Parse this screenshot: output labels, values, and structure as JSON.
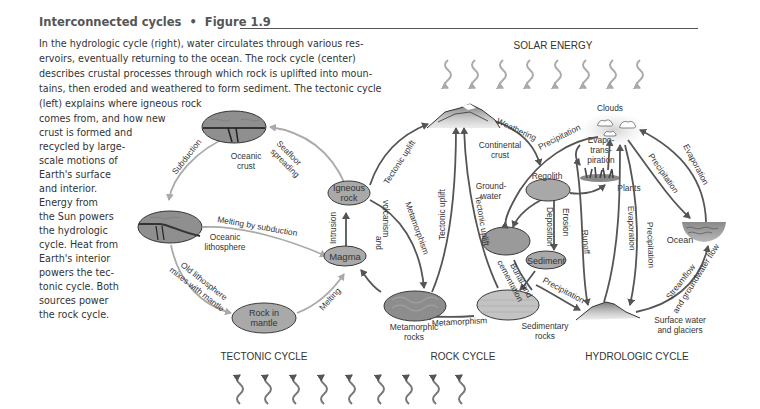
{
  "figure": {
    "title": "Interconnected cycles",
    "separator": "•",
    "number": "Figure 1.9",
    "caption_lines": [
      "In the hydrologic cycle (right), water circulates through various res-",
      "ervoirs, eventually returning to the ocean. The rock cycle (center)",
      "describes crustal processes through which rock is uplifted into moun-",
      "tains, then eroded and weathered to form sediment. The tectonic cycle",
      "(left) explains where igneous rock",
      "comes from, and how new",
      "crust is formed and",
      "recycled by large-",
      "scale motions of",
      "Earth's surface",
      "and interior.",
      "Energy from",
      "the Sun powers",
      "the hydrologic",
      "cycle. Heat from",
      "Earth's interior",
      "powers the tec-",
      "tonic cycle. Both",
      "sources power",
      "the rock cycle."
    ]
  },
  "energy": {
    "solar_label": "SOLAR ENERGY",
    "solar_arrow_count": 8,
    "internal_arrow_count": 9
  },
  "cycles": {
    "tectonic": "TECTONIC CYCLE",
    "rock": "ROCK CYCLE",
    "hydrologic": "HYDROLOGIC CYCLE"
  },
  "nodes": {
    "oceanic_crust": [
      "Oceanic",
      "crust"
    ],
    "oceanic_lithosphere": [
      "Oceanic",
      "lithosphere"
    ],
    "rock_in_mantle": [
      "Rock in",
      "mantle"
    ],
    "igneous_rock": [
      "Igneous",
      "rock"
    ],
    "magma": "Magma",
    "metamorphic_rocks": [
      "Metamorphic",
      "rocks"
    ],
    "sedimentary_rocks": [
      "Sedimentary",
      "rocks"
    ],
    "continental_crust": [
      "Continental",
      "crust"
    ],
    "groundwater": [
      "Ground-",
      "water"
    ],
    "regolith": "Regolith",
    "sediment": "Sediment",
    "clouds": "Clouds",
    "evapotranspiration": [
      "Evapo-",
      "trans-",
      "piration"
    ],
    "plants": "Plants",
    "ocean": "Ocean",
    "surface_water": [
      "Surface water",
      "and glaciers"
    ]
  },
  "processes": {
    "subduction": "Subduction",
    "seafloor_spreading": [
      "Seafloor",
      "spreading"
    ],
    "melting_by_subduction": "Melting by subduction",
    "old_lithosphere": [
      "Old lithosphere",
      "mixes with mantle"
    ],
    "melting": "Melting",
    "tectonic_uplift": "Tectonic uplift",
    "intrusion_volcanism": [
      "Intrusion",
      "and",
      "volcanism"
    ],
    "metamorphism": "Metamorphism",
    "weathering": "Weathering",
    "burial_cementation": [
      "Burial and",
      "cementation"
    ],
    "deposition": "Deposition",
    "erosion": "Erosion",
    "runoff": "Runoff",
    "precipitation": "Precipitation",
    "evaporation": "Evaporation",
    "streamflow": [
      "Streamflow",
      "and groundwater flow"
    ]
  },
  "colors": {
    "node_fill": "#a9a9a9",
    "node_stroke": "#3a3a3a",
    "arrow_dark": "#555555",
    "arrow_light": "#a8a8a8",
    "title": "#555555",
    "text": "#333333"
  }
}
